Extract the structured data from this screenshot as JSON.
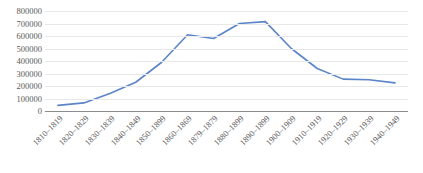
{
  "chart_data": {
    "type": "line",
    "title": "",
    "subtitle": "",
    "xlabel": "",
    "ylabel": "",
    "categories": [
      "1810–1819",
      "1820–1829",
      "1830–1839",
      "1840–1849",
      "1850–1899",
      "1860–1869",
      "1879–1879",
      "1880–1899",
      "1890–1899",
      "1900–1909",
      "1910–1919",
      "1920–1929",
      "1930–1939",
      "1940–1949"
    ],
    "values": [
      45000,
      65000,
      140000,
      230000,
      390000,
      610000,
      580000,
      700000,
      715000,
      500000,
      340000,
      255000,
      250000,
      225000
    ],
    "series": [
      {
        "name": "",
        "values": [
          45000,
          65000,
          140000,
          230000,
          390000,
          610000,
          580000,
          700000,
          715000,
          500000,
          340000,
          255000,
          250000,
          225000
        ]
      }
    ],
    "ylim": [
      0,
      800000
    ],
    "ytick_labels": [
      "800000",
      "700000",
      "600000",
      "500000",
      "400000",
      "300000",
      "200000",
      "100000",
      "0"
    ],
    "ytick_values": [
      800000,
      700000,
      600000,
      500000,
      400000,
      300000,
      200000,
      100000,
      0
    ],
    "grid": true,
    "legend": false,
    "legend_position": "none",
    "markers": false,
    "colors": {
      "line": "#5b85c8",
      "gridline": "#e8e8e8",
      "axis": "#8c8c8c",
      "tick_text": "#595959",
      "background": "#ffffff"
    }
  }
}
